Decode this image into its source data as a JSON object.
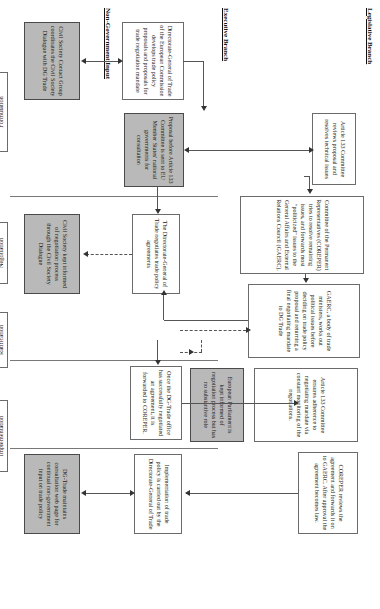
{
  "diagram": {
    "orientation": "rotated-90",
    "branches": [
      {
        "id": "legislative",
        "label": "Legislative Branch"
      },
      {
        "id": "executive",
        "label": "Executive Branch"
      },
      {
        "id": "nongov",
        "label": "Non-Government Input"
      }
    ],
    "stages": [
      {
        "id": "formulation",
        "label": "Formulation"
      },
      {
        "id": "negotiation",
        "label": "Negotiation"
      },
      {
        "id": "ratification",
        "label": "Ratification"
      },
      {
        "id": "implementation",
        "label": "Implementation"
      }
    ],
    "nodes": {
      "dg_trade_develops": "Directorate-General of Trade of the European Commission develops trade policy proposals and proposals for trade negotiation mandate",
      "proposal_member_states": "Proposal before Article 133 Committee is sent to EU Member States' national governments for consultation",
      "art133_reviews": "Article 133 Committee reviews proposal and resolves technical issues",
      "coreper_resolves": "Committee of the Permanent Representatives (COREPER) tries to resolve remaining issues, and forwards most \"politicized\" issues to the General Affairs and External Relations Council (GAERC).",
      "gaerc_ministers": "GAERC, a body of trade ministers, works out political issues before deciding on trade policy proposal and returning a final negotiating mandate to DG Trade",
      "civil_society_contact": "Civil Society Contact Group coordinates the Civil Society Dialogue with DG Trade",
      "dg_trade_negotiates": "The Directorate-General of Trade negotiates trade policy agreements",
      "art133_adherence": "Article 133 Committee ensures adherence to negotiating mandate via constant monitoring of the negotiations.",
      "ep_informed": "European Parliament is kept informed of negotiation process but has no substantive role",
      "civil_society_informed": "Civil Society kept informed of negotiation process through the Civil Society Dialogue",
      "dg_trade_forwards": "Once the DG-Trade office has successfully negotiated an agreement, it is forwarded to COREPER.",
      "coreper_reviews": "COREPER reviews the agreement and forwards it on to GAERC. After approval the agreement becomes law.",
      "implementation_dg": "Implementation of trade policy is carried out by the Directorate-General of Trade",
      "dg_trade_webpage": "DG-Trade maintains consultation web page for continual non-government input on trade policy"
    },
    "colors": {
      "shaded_fill": "#b9b9b9",
      "plain_fill": "#ffffff",
      "border": "#6b6b6b",
      "connector": "#555555"
    }
  }
}
